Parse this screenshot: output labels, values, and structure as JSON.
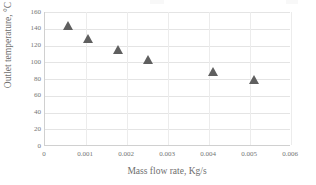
{
  "chart_data": {
    "type": "scatter",
    "title": "",
    "xlabel": "Mass flow rate, Kg/s",
    "ylabel": "Outlet temperature, °C",
    "xlim": [
      0,
      0.006
    ],
    "ylim": [
      0,
      160
    ],
    "grid": true,
    "legend": "none",
    "marker": "triangle",
    "marker_color": "#5f5f5f",
    "xticks": [
      "0",
      "0.001",
      "0.002",
      "0.003",
      "0.004",
      "0.005",
      "0.006"
    ],
    "xtick_values": [
      0,
      0.001,
      0.002,
      0.003,
      0.004,
      0.005,
      0.006
    ],
    "yticks": [
      "0",
      "20",
      "40",
      "60",
      "80",
      "100",
      "120",
      "140",
      "160"
    ],
    "ytick_values": [
      0,
      20,
      40,
      60,
      80,
      100,
      120,
      140,
      160
    ],
    "series": [
      {
        "name": "Outlet temperature",
        "x": [
          0.00055,
          0.00105,
          0.00178,
          0.0025,
          0.0041,
          0.0051
        ],
        "y": [
          141.5,
          127.0,
          113.5,
          101.0,
          87.0,
          77.5
        ]
      }
    ],
    "points": [
      {
        "x": 0.00055,
        "y": 141.5
      },
      {
        "x": 0.00105,
        "y": 127.0
      },
      {
        "x": 0.00178,
        "y": 113.5
      },
      {
        "x": 0.0025,
        "y": 101.0
      },
      {
        "x": 0.0041,
        "y": 87.0
      },
      {
        "x": 0.0051,
        "y": 77.5
      }
    ]
  },
  "colors": {
    "marker": "#5f5f5f",
    "gridline": "#e4e4e4",
    "axis": "#d0d0d0",
    "text": "#6e6e6e",
    "background": "#ffffff"
  }
}
